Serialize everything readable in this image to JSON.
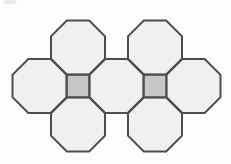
{
  "figure": {
    "background": "#fdfdfd",
    "stroke_color": "#4d4d4d",
    "stroke_width": 2,
    "octagon": {
      "fill": "#f0f0f0",
      "width": 54,
      "centers": [
        {
          "x": 78,
          "y": 47.5
        },
        {
          "x": 155,
          "y": 47.5
        },
        {
          "x": 39.5,
          "y": 86
        },
        {
          "x": 116.5,
          "y": 86
        },
        {
          "x": 193.5,
          "y": 86
        },
        {
          "x": 78,
          "y": 124.5
        },
        {
          "x": 155,
          "y": 124.5
        }
      ]
    },
    "square": {
      "fill": "#c6c6c6",
      "side": 22.4,
      "centers": [
        {
          "x": 78,
          "y": 86
        },
        {
          "x": 155,
          "y": 86
        }
      ]
    },
    "artifact": {
      "color": "#e9e9e9",
      "x": 10,
      "y": 2,
      "rx": 7,
      "ry": 2
    }
  }
}
